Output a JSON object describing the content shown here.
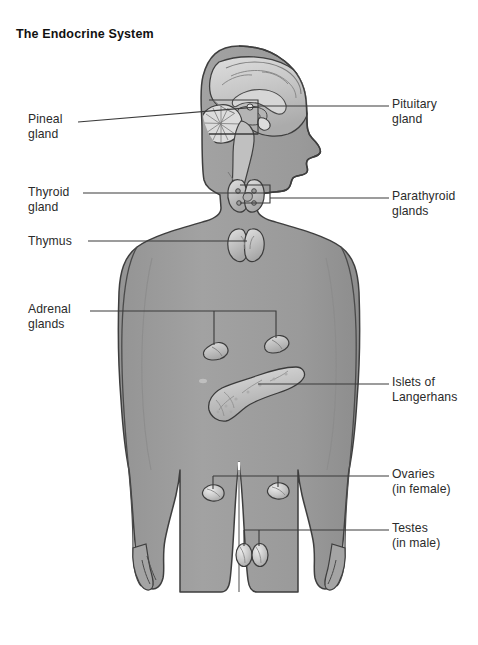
{
  "figure": {
    "title": "The Endocrine System",
    "background_color": "#ffffff",
    "body_fill": "#9c9c9c",
    "body_outline": "#3a3a3a",
    "organ_fill": "#c9c9c9",
    "organ_outline": "#3c3c3c",
    "leader_line_color": "#3a3a3a",
    "text_color": "#2b2b2b"
  },
  "labels": {
    "left": [
      {
        "id": "pineal",
        "text": "Pineal\ngland",
        "x": 28,
        "y": 112,
        "line": {
          "x1": 78,
          "y1": 121,
          "x2": 258,
          "y2": 107
        }
      },
      {
        "id": "thyroid",
        "text": "Thyroid\ngland",
        "x": 28,
        "y": 186,
        "line": {
          "x1": 83,
          "y1": 193,
          "x2": 270,
          "y2": 193
        }
      },
      {
        "id": "thymus",
        "text": "Thymus",
        "x": 28,
        "y": 235,
        "line": {
          "x1": 88,
          "y1": 241,
          "x2": 245,
          "y2": 241
        }
      },
      {
        "id": "adrenal",
        "text": "Adrenal\nglands",
        "x": 28,
        "y": 303,
        "line": {
          "x1": 90,
          "y1": 311,
          "x2": 214,
          "y2": 311
        }
      }
    ],
    "right": [
      {
        "id": "pituitary",
        "text": "Pituitary\ngland",
        "x": 392,
        "y": 97,
        "line": {
          "x1": 268,
          "y1": 106,
          "x2": 389,
          "y2": 106
        }
      },
      {
        "id": "parathyroid",
        "text": "Parathyroid\nglands",
        "x": 392,
        "y": 189,
        "line": {
          "x1": 258,
          "y1": 198,
          "x2": 389,
          "y2": 198
        }
      },
      {
        "id": "islets",
        "text": "Islets of\nLangerhans",
        "x": 392,
        "y": 375,
        "line": {
          "x1": 258,
          "y1": 384,
          "x2": 389,
          "y2": 384
        }
      },
      {
        "id": "ovaries",
        "text": "Ovaries\n(in female)",
        "x": 392,
        "y": 467,
        "line": {
          "x1": 360,
          "y1": 476,
          "x2": 389,
          "y2": 476
        }
      },
      {
        "id": "testes",
        "text": "Testes\n(in male)",
        "x": 392,
        "y": 521,
        "line": {
          "x1": 360,
          "y1": 530,
          "x2": 389,
          "y2": 530
        }
      }
    ]
  },
  "brackets": {
    "adrenal": {
      "y": 311,
      "x_left": 214,
      "x_right": 276,
      "drop_left_y": 345,
      "drop_right_y": 338
    },
    "ovaries": {
      "y": 476,
      "x_left": 213,
      "x_right": 360,
      "drop_left_x": 213,
      "drop_left_y": 492,
      "drop_right_x": 278,
      "drop_right_y": 490
    },
    "testes": {
      "y": 530,
      "x_left": 244,
      "x_right": 360,
      "drop_left_x": 244,
      "drop_left_y": 545,
      "drop_right_x": 259,
      "drop_right_y": 545
    }
  },
  "organs": [
    {
      "id": "brain",
      "name": "brain-sagittal-section"
    },
    {
      "id": "pituitary",
      "name": "pituitary-gland"
    },
    {
      "id": "pineal",
      "name": "pineal-gland"
    },
    {
      "id": "thyroid",
      "name": "thyroid-gland"
    },
    {
      "id": "parathyroid",
      "name": "parathyroid-glands"
    },
    {
      "id": "thymus",
      "name": "thymus"
    },
    {
      "id": "adrenal-left",
      "name": "adrenal-gland-left"
    },
    {
      "id": "adrenal-right",
      "name": "adrenal-gland-right"
    },
    {
      "id": "pancreas",
      "name": "pancreas-islets-of-langerhans"
    },
    {
      "id": "ovary-left",
      "name": "ovary-left"
    },
    {
      "id": "ovary-right",
      "name": "ovary-right"
    },
    {
      "id": "testis-left",
      "name": "testis-left"
    },
    {
      "id": "testis-right",
      "name": "testis-right"
    }
  ]
}
